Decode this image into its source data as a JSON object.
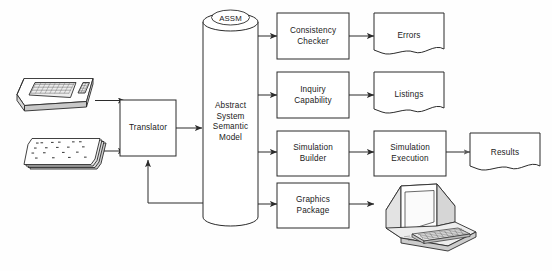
{
  "diagram": {
    "stroke_color": "#2b2b2b",
    "background_color": "#fefefe",
    "nodes": {
      "terminal_input": {
        "name": "keyboard-terminal-input",
        "label": ""
      },
      "punched_cards": {
        "name": "punched-card-deck",
        "label": ""
      },
      "translator": {
        "label": "Translator"
      },
      "assm_cylinder": {
        "top_label": "ASSM",
        "body_label": "Abstract\nSystem\nSemantic\nModel"
      },
      "consistency_checker": {
        "label": "Consistency\nChecker"
      },
      "errors": {
        "label": "Errors"
      },
      "inquiry_capability": {
        "label": "Inquiry\nCapability"
      },
      "listings": {
        "label": "Listings"
      },
      "simulation_builder": {
        "label": "Simulation\nBuilder"
      },
      "simulation_execution": {
        "label": "Simulation\nExecution"
      },
      "results": {
        "label": "Results"
      },
      "graphics_package": {
        "label": "Graphics\nPackage"
      },
      "crt_display": {
        "name": "crt-terminal-output",
        "label": ""
      }
    },
    "edges": [
      {
        "from": "terminal_input",
        "to": "translator"
      },
      {
        "from": "punched_cards",
        "to": "translator"
      },
      {
        "from": "translator",
        "to": "assm_cylinder"
      },
      {
        "from": "assm_cylinder",
        "to": "consistency_checker"
      },
      {
        "from": "consistency_checker",
        "to": "errors"
      },
      {
        "from": "assm_cylinder",
        "to": "inquiry_capability"
      },
      {
        "from": "inquiry_capability",
        "to": "listings"
      },
      {
        "from": "assm_cylinder",
        "to": "simulation_builder"
      },
      {
        "from": "simulation_builder",
        "to": "simulation_execution"
      },
      {
        "from": "simulation_execution",
        "to": "results"
      },
      {
        "from": "assm_cylinder",
        "to": "graphics_package"
      },
      {
        "from": "graphics_package",
        "to": "crt_display"
      },
      {
        "from": "assm_cylinder",
        "to": "translator"
      }
    ]
  }
}
